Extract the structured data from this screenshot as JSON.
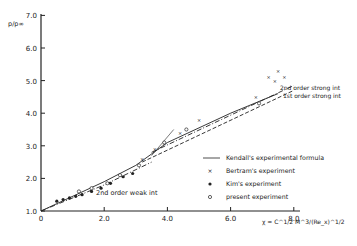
{
  "chart_data": {
    "type": "scatter",
    "title": "",
    "ylabel": "p/p∞",
    "xlabel": "χ = C^1/2 M^3/(Re_x)^1/2",
    "xlim": [
      0,
      8.0
    ],
    "ylim": [
      1.0,
      7.0
    ],
    "x_ticks": [
      "0",
      "2.0",
      "4.0",
      "6.0",
      "8.0"
    ],
    "y_ticks": [
      "1.0",
      "2.0",
      "3.0",
      "4.0",
      "5.0",
      "6.0",
      "7.0"
    ],
    "grid": false,
    "legend_position": "lower right",
    "legend": [
      {
        "marker": "line",
        "label": "Kendall's experimental formula"
      },
      {
        "marker": "x",
        "label": "Bertram's experiment"
      },
      {
        "marker": "filled-circle",
        "label": "Kim's experiment"
      },
      {
        "marker": "open-circle",
        "label": "present experiment"
      }
    ],
    "curves": [
      {
        "name": "Kendall's experimental formula",
        "style": "solid",
        "points": [
          [
            0,
            1.0
          ],
          [
            2.0,
            1.9
          ],
          [
            3.0,
            2.4
          ],
          [
            4.0,
            3.1
          ],
          [
            6.0,
            4.0
          ],
          [
            7.5,
            4.6
          ]
        ]
      },
      {
        "name": "2nd order weak int",
        "style": "dash-dot",
        "points": [
          [
            0,
            1.0
          ],
          [
            2.0,
            1.8
          ],
          [
            3.5,
            2.5
          ]
        ]
      },
      {
        "name": "2nd order strong int",
        "style": "dash-dot",
        "points": [
          [
            3.5,
            2.8
          ],
          [
            8.0,
            4.85
          ]
        ]
      },
      {
        "name": "1st order strong int",
        "style": "dashed",
        "points": [
          [
            3.2,
            2.5
          ],
          [
            8.0,
            4.7
          ]
        ]
      }
    ],
    "annotations": [
      "2nd order strong int",
      "1st order strong int",
      "2nd order weak int"
    ],
    "series": [
      {
        "name": "Bertram's experiment",
        "marker": "x",
        "points": [
          [
            3.2,
            2.6
          ],
          [
            3.6,
            2.9
          ],
          [
            3.9,
            3.1
          ],
          [
            4.4,
            3.4
          ],
          [
            5.0,
            3.8
          ],
          [
            6.8,
            4.5
          ],
          [
            7.2,
            5.1
          ],
          [
            7.4,
            5.0
          ],
          [
            7.5,
            5.3
          ],
          [
            7.7,
            5.1
          ]
        ]
      },
      {
        "name": "Kim's experiment",
        "marker": "filled-circle",
        "points": [
          [
            0.5,
            1.3
          ],
          [
            0.7,
            1.35
          ],
          [
            0.9,
            1.4
          ],
          [
            1.1,
            1.45
          ],
          [
            1.3,
            1.5
          ],
          [
            1.6,
            1.6
          ],
          [
            1.9,
            1.7
          ],
          [
            2.2,
            1.85
          ],
          [
            2.6,
            2.05
          ],
          [
            2.9,
            2.15
          ]
        ]
      },
      {
        "name": "present experiment",
        "marker": "open-circle",
        "points": [
          [
            1.2,
            1.6
          ],
          [
            1.6,
            1.7
          ],
          [
            2.1,
            1.85
          ],
          [
            2.5,
            2.1
          ],
          [
            3.1,
            2.4
          ],
          [
            3.9,
            3.1
          ],
          [
            4.6,
            3.5
          ],
          [
            6.9,
            4.3
          ]
        ]
      }
    ]
  }
}
